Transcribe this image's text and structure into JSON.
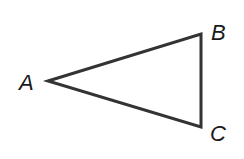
{
  "diagram": {
    "type": "triangle",
    "stroke_color": "#333333",
    "stroke_width": 3,
    "fill": "none",
    "vertices": [
      {
        "label": "A",
        "x": 48,
        "y": 81,
        "label_x": 19,
        "label_y": 90
      },
      {
        "label": "B",
        "x": 201,
        "y": 34,
        "label_x": 211,
        "label_y": 40
      },
      {
        "label": "C",
        "x": 201,
        "y": 127,
        "label_x": 210,
        "label_y": 141
      }
    ]
  }
}
